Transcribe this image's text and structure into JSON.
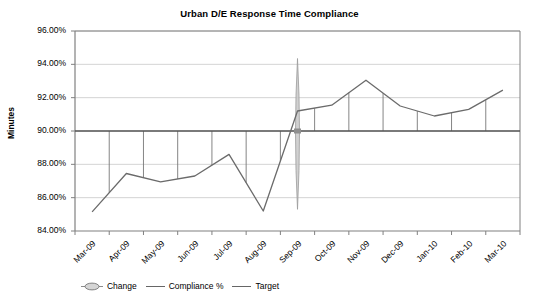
{
  "chart_data": {
    "type": "line",
    "title": "Urban D/E Response Time Compliance",
    "xlabel": "",
    "ylabel": "Minutes",
    "ylim": [
      84.0,
      96.0
    ],
    "ytick_step": 2.0,
    "ytick_labels": [
      "96.00%",
      "94.00%",
      "92.00%",
      "90.00%",
      "88.00%",
      "86.00%",
      "84.00%"
    ],
    "ytick_values": [
      96.0,
      94.0,
      92.0,
      90.0,
      88.0,
      86.0,
      84.0
    ],
    "grid": true,
    "legend_position": "bottom-left",
    "categories": [
      "Mar-09",
      "Apr-09",
      "May-09",
      "Jun-09",
      "Jul-09",
      "Aug-09",
      "Sep-09",
      "Oct-09",
      "Nov-09",
      "Dec-09",
      "Jan-10",
      "Feb-10",
      "Mar-10"
    ],
    "series": [
      {
        "name": "Compliance %",
        "type": "line",
        "color": "#6b6b6b",
        "values": [
          85.15,
          87.45,
          86.95,
          87.3,
          88.6,
          85.2,
          91.2,
          91.55,
          93.05,
          91.5,
          90.9,
          91.3,
          92.45
        ]
      },
      {
        "name": "Target",
        "type": "line",
        "color": "#555555",
        "constant": 90.0,
        "values": [
          90.0,
          90.0,
          90.0,
          90.0,
          90.0,
          90.0,
          90.0,
          90.0,
          90.0,
          90.0,
          90.0,
          90.0,
          90.0
        ]
      },
      {
        "name": "Change",
        "type": "marker",
        "color": "#b5b5b5",
        "at_category": "Sep-09",
        "span_low": 85.3,
        "span_high": 94.35,
        "center": 90.0
      }
    ]
  },
  "legend": {
    "items": [
      {
        "label": "Change",
        "marker": "change-lens-icon",
        "color": "#b5b5b5"
      },
      {
        "label": "Compliance %",
        "marker": "line-icon",
        "color": "#6b6b6b"
      },
      {
        "label": "Target",
        "marker": "line-icon",
        "color": "#555555"
      }
    ]
  }
}
